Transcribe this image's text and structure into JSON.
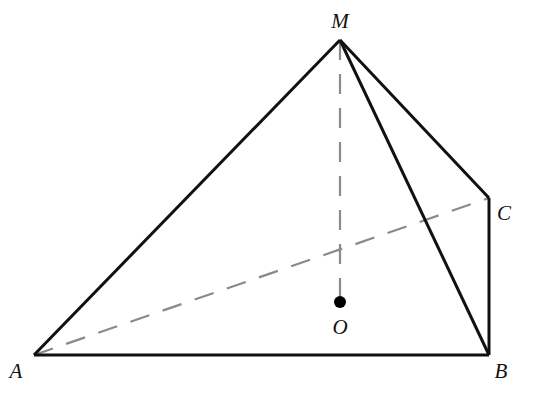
{
  "diagram": {
    "colors": {
      "solid": "#111111",
      "dashed": "#8a8a8a",
      "point": "#000000"
    },
    "points": {
      "M": {
        "label": "M",
        "x": 340,
        "y": 40,
        "lx": 340,
        "ly": 28
      },
      "A": {
        "label": "A",
        "x": 34,
        "y": 355,
        "lx": 16,
        "ly": 378
      },
      "B": {
        "label": "B",
        "x": 489,
        "y": 355,
        "lx": 501,
        "ly": 378
      },
      "C": {
        "label": "C",
        "x": 489,
        "y": 198,
        "lx": 504,
        "ly": 220
      },
      "O": {
        "label": "O",
        "x": 340,
        "y": 302,
        "lx": 340,
        "ly": 334
      }
    },
    "solid_edges": [
      [
        "M",
        "A"
      ],
      [
        "M",
        "B"
      ],
      [
        "M",
        "C"
      ],
      [
        "A",
        "B"
      ],
      [
        "B",
        "C"
      ]
    ],
    "dashed_edges": [
      [
        "A",
        "C"
      ],
      [
        "M",
        "O"
      ]
    ]
  }
}
